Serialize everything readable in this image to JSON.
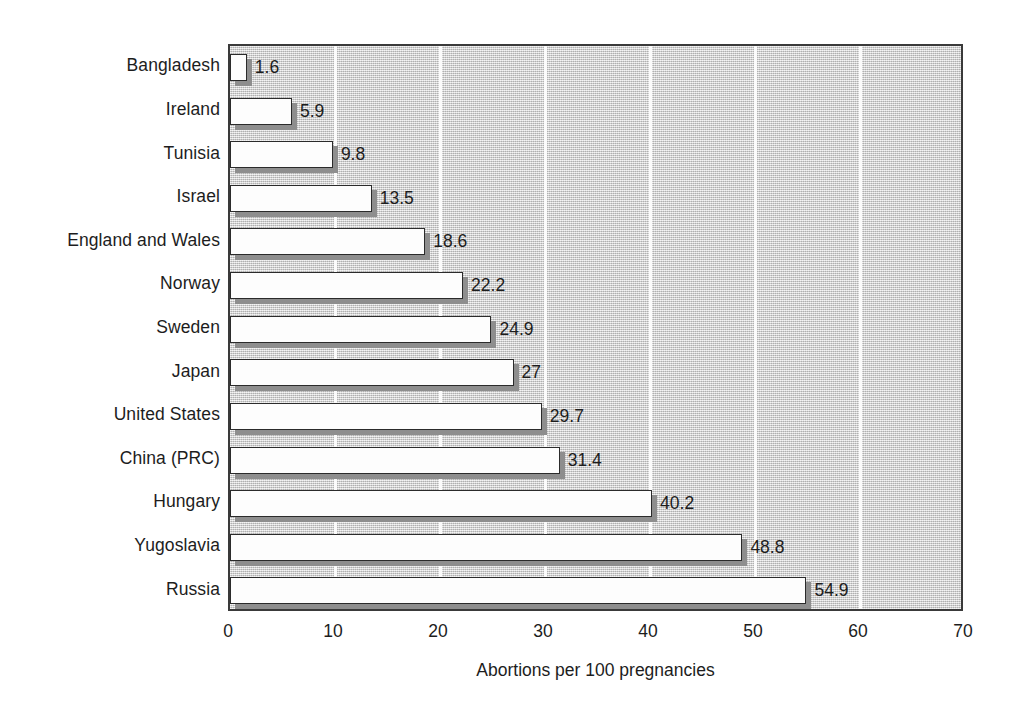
{
  "chart_data": {
    "type": "bar",
    "orientation": "horizontal",
    "title": "",
    "xlabel": "Abortions per 100 pregnancies",
    "ylabel": "",
    "xlim": [
      0,
      70
    ],
    "xticks": [
      "0",
      "10",
      "20",
      "30",
      "40",
      "50",
      "60",
      "70"
    ],
    "grid": true,
    "legend": "none",
    "categories": [
      "Bangladesh",
      "Ireland",
      "Tunisia",
      "Israel",
      "England and Wales",
      "Norway",
      "Sweden",
      "Japan",
      "United States",
      "China (PRC)",
      "Hungary",
      "Yugoslavia",
      "Russia"
    ],
    "values": [
      1.6,
      5.9,
      9.8,
      13.5,
      18.6,
      22.2,
      24.9,
      27,
      29.7,
      31.4,
      40.2,
      48.8,
      54.9
    ],
    "value_labels": [
      "1.6",
      "5.9",
      "9.8",
      "13.5",
      "18.6",
      "22.2",
      "24.9",
      "27",
      "29.7",
      "31.4",
      "40.2",
      "48.8",
      "54.9"
    ],
    "colors": {
      "bar_fill": "#fdfdfd",
      "bar_edge": "#2b2b2b",
      "bar_shadow": "#8e8e8e",
      "plot_background": "#d2d2d2",
      "gridline": "#fbfbfb",
      "frame": "#3a3a3a",
      "text": "#1d1d1d"
    }
  }
}
